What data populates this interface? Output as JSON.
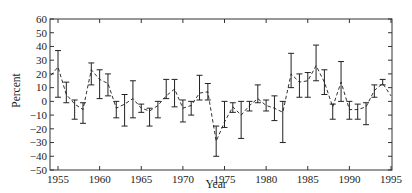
{
  "chart_data": {
    "type": "line",
    "title": "",
    "xlabel": "Year",
    "ylabel": "Percent",
    "xlim": [
      1954,
      1995
    ],
    "ylim": [
      -50,
      60
    ],
    "x_ticks": [
      1955,
      1960,
      1965,
      1970,
      1975,
      1980,
      1985,
      1990,
      1995
    ],
    "y_ticks": [
      60,
      50,
      40,
      30,
      20,
      10,
      0,
      -10,
      -20,
      -30,
      -40,
      -50
    ],
    "grid": false,
    "legend": null,
    "line_style": "dashed",
    "error_bars": true,
    "series": [
      {
        "name": "Percent",
        "x": [
          1954,
          1955,
          1956,
          1957,
          1958,
          1959,
          1960,
          1961,
          1962,
          1963,
          1964,
          1965,
          1966,
          1967,
          1968,
          1969,
          1970,
          1971,
          1972,
          1973,
          1974,
          1975,
          1976,
          1977,
          1978,
          1979,
          1980,
          1981,
          1982,
          1983,
          1984,
          1985,
          1986,
          1987,
          1988,
          1989,
          1990,
          1991,
          1992,
          1993,
          1994,
          1995
        ],
        "values": [
          19,
          25,
          5,
          -2,
          -6,
          23,
          16,
          13,
          -5,
          -2,
          2,
          -5,
          -7,
          -3,
          4,
          9,
          -5,
          -3,
          6,
          7,
          -29,
          -15,
          -4,
          -10,
          -3,
          2,
          -3,
          -5,
          -8,
          20,
          14,
          15,
          26,
          14,
          -4,
          14,
          -6,
          -6,
          -4,
          8,
          13,
          4
        ],
        "err_low": [
          null,
          3,
          -1,
          -13,
          -16,
          12,
          2,
          4,
          -12,
          -18,
          -12,
          -8,
          -18,
          -12,
          2,
          -4,
          -15,
          -10,
          1,
          1,
          -40,
          -19,
          -8,
          -27,
          -7,
          -1,
          -7,
          -14,
          -30,
          10,
          3,
          3,
          15,
          5,
          -13,
          0,
          -13,
          -13,
          -17,
          3,
          12,
          null
        ],
        "err_high": [
          null,
          37,
          14,
          1,
          -1,
          28,
          23,
          20,
          0,
          5,
          15,
          -2,
          -5,
          0,
          16,
          16,
          1,
          0,
          19,
          13,
          -18,
          0,
          -1,
          0,
          0,
          12,
          1,
          4,
          0,
          35,
          20,
          21,
          41,
          23,
          -2,
          29,
          0,
          -2,
          -1,
          12,
          16,
          null
        ]
      }
    ]
  },
  "axes": {
    "xlabel": "Year",
    "ylabel": "Percent"
  },
  "colors": {
    "line": "#1a1a1a",
    "axis": "#333333",
    "background": "#ffffff"
  }
}
